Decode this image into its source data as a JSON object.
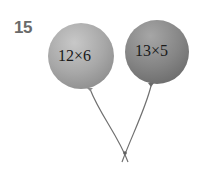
{
  "problem": {
    "number": "15",
    "balloons": [
      {
        "expression": "12×6",
        "color": "#a9a9a9"
      },
      {
        "expression": "13×5",
        "color": "#8a8a8a"
      }
    ],
    "string_color": "#6f6f6f"
  }
}
